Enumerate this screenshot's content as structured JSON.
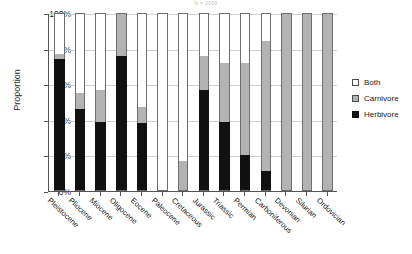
{
  "chart_data": {
    "type": "bar",
    "subtype": "stacked-100-percent",
    "title": "N = 2000",
    "xlabel": "",
    "ylabel": "Proportion",
    "ylim": [
      0,
      100
    ],
    "yticks": [
      "0%",
      "20%",
      "40%",
      "60%",
      "80%",
      "100%"
    ],
    "ytick_values": [
      0,
      20,
      40,
      60,
      80,
      100
    ],
    "grid": true,
    "legend_position": "right",
    "categories": [
      "Pleistocene",
      "Pliocene",
      "Miocene",
      "Oligocene",
      "Eocene",
      "Paleocene",
      "Cretaceous",
      "Jurassic",
      "Triassic",
      "Permian",
      "Carboniferous",
      "Devonian",
      "Silurian",
      "Ordovician"
    ],
    "series": [
      {
        "name": "Herbivore",
        "color": "#111111",
        "values": [
          74,
          46,
          39,
          76,
          38,
          0,
          0,
          57,
          39,
          20,
          11,
          0,
          0,
          0
        ]
      },
      {
        "name": "Carnivore",
        "color": "#b3b3b3",
        "values": [
          3,
          9,
          18,
          24,
          9,
          0,
          17,
          19,
          33,
          52,
          73,
          100,
          100,
          100
        ]
      },
      {
        "name": "Both",
        "color": "#ffffff",
        "values": [
          23,
          45,
          43,
          0,
          53,
          100,
          83,
          24,
          28,
          28,
          16,
          0,
          0,
          0
        ]
      }
    ]
  },
  "legend": {
    "items": [
      {
        "label": "Both",
        "swatch": "both"
      },
      {
        "label": "Carnivore",
        "swatch": "carnivore"
      },
      {
        "label": "Herbivore",
        "swatch": "herbivore"
      }
    ]
  }
}
